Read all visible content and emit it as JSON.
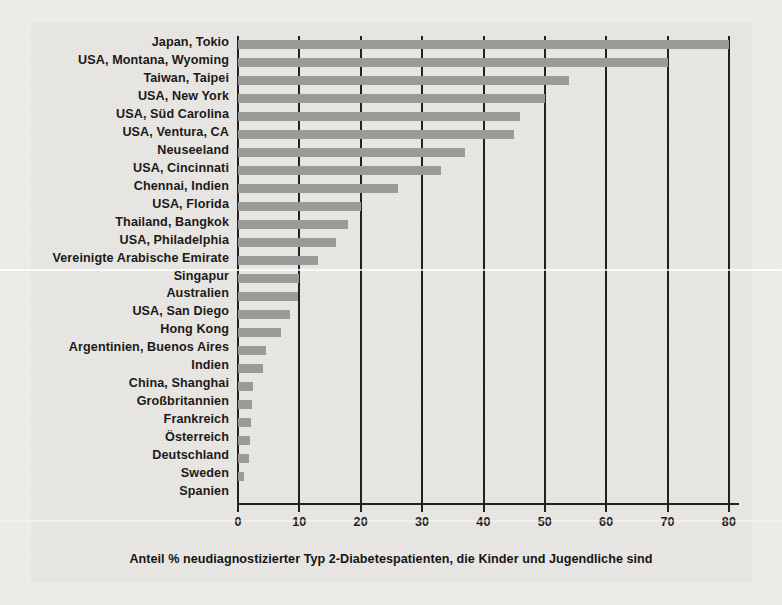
{
  "chart_data": {
    "type": "bar",
    "orientation": "horizontal",
    "title": "",
    "xlabel": "Anteil % neudiagnostizierter Typ 2-Diabetespatienten, die Kinder und Jugendliche sind",
    "ylabel": "",
    "xlim": [
      0,
      80
    ],
    "xticks": [
      0,
      10,
      20,
      30,
      40,
      50,
      60,
      70,
      80
    ],
    "xtick_labels": [
      "0",
      "10",
      "20",
      "30",
      "40",
      "50",
      "60",
      "70",
      "80"
    ],
    "grid": "vertical",
    "legend": "none",
    "bar_color": "#9b9a98",
    "axis_color": "#23211f",
    "panel_color": "#e8e6e2",
    "categories": [
      "Japan, Tokio",
      "USA, Montana, Wyoming",
      "Taiwan, Taipei",
      "USA, New York",
      "USA, Süd Carolina",
      "USA, Ventura, CA",
      "Neuseeland",
      "USA, Cincinnati",
      "Chennai, Indien",
      "USA, Florida",
      "Thailand, Bangkok",
      "USA, Philadelphia",
      "Vereinigte Arabische Emirate",
      "Singapur",
      "Australien",
      "USA, San Diego",
      "Hong Kong",
      "Argentinien, Buenos Aires",
      "Indien",
      "China, Shanghai",
      "Großbritannien",
      "Frankreich",
      "Österreich",
      "Deutschland",
      "Sweden",
      "Spanien"
    ],
    "values": [
      80,
      70,
      54,
      50,
      46,
      45,
      37,
      33,
      26,
      20,
      18,
      16,
      13,
      10,
      9.7,
      8.5,
      7,
      4.6,
      4,
      2.5,
      2.3,
      2.1,
      2,
      1.8,
      1,
      0
    ]
  },
  "ghost_text": {
    "line1": "und",
    "line2": "rhoben . Dies wird nach",
    "line3": "Text liegt hier verdeckt",
    "line4": "Zur Bestimmung von gilt heute",
    "line5": "le 1 Unterteilungsform Tabelle b",
    "line6": "Die Abschätzung"
  }
}
